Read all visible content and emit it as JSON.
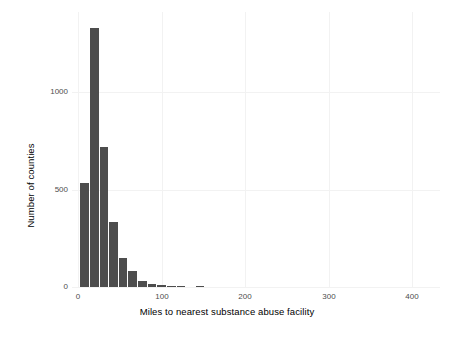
{
  "chart_data": {
    "type": "bar",
    "title": "",
    "subtitle": "",
    "xlabel": "Miles to nearest substance abuse facility",
    "ylabel": "Number of counties",
    "xlim": [
      -10,
      430
    ],
    "ylim": [
      0,
      1400
    ],
    "xticks": [
      0,
      100,
      200,
      300,
      400
    ],
    "xticklabels": [
      "0",
      "100",
      "200",
      "300",
      "400"
    ],
    "yticks": [
      0,
      500,
      1000
    ],
    "yticklabels": [
      "0",
      "500",
      "1000"
    ],
    "grid": true,
    "legend": "none",
    "bar_color": "#4d4d4d",
    "background_color": "#ffffff",
    "gridline_color": "#f2f2f2",
    "binwidth": 11.5,
    "bins": [
      {
        "x_start": 0,
        "x_end": 11.5,
        "value": 533
      },
      {
        "x_start": 11.5,
        "x_end": 23,
        "value": 1328
      },
      {
        "x_start": 23,
        "x_end": 34.5,
        "value": 718
      },
      {
        "x_start": 34.5,
        "x_end": 46,
        "value": 333
      },
      {
        "x_start": 46,
        "x_end": 57.5,
        "value": 149
      },
      {
        "x_start": 57.5,
        "x_end": 69,
        "value": 82
      },
      {
        "x_start": 69,
        "x_end": 80.5,
        "value": 31
      },
      {
        "x_start": 80.5,
        "x_end": 92,
        "value": 15
      },
      {
        "x_start": 92,
        "x_end": 103.5,
        "value": 8
      },
      {
        "x_start": 103.5,
        "x_end": 115,
        "value": 6
      },
      {
        "x_start": 115,
        "x_end": 126.5,
        "value": 3
      },
      {
        "x_start": 138,
        "x_end": 149.5,
        "value": 3
      }
    ],
    "categories": [
      "0-11.5",
      "11.5-23",
      "23-34.5",
      "34.5-46",
      "46-57.5",
      "57.5-69",
      "69-80.5",
      "80.5-92",
      "92-103.5",
      "103.5-115",
      "115-126.5",
      "138-149.5"
    ],
    "values": [
      533,
      1328,
      718,
      333,
      149,
      82,
      31,
      15,
      8,
      6,
      3,
      3
    ]
  }
}
